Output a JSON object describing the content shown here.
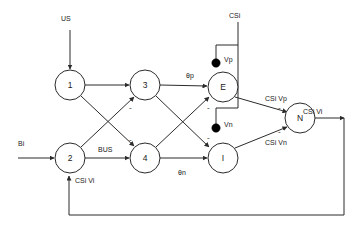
{
  "diagram": {
    "nodes": [
      {
        "id": "n1",
        "label": "1",
        "cx": 70,
        "cy": 85,
        "r": 15
      },
      {
        "id": "n2",
        "label": "2",
        "cx": 70,
        "cy": 158,
        "r": 15
      },
      {
        "id": "n3",
        "label": "3",
        "cx": 145,
        "cy": 85,
        "r": 15
      },
      {
        "id": "n4",
        "label": "4",
        "cx": 145,
        "cy": 158,
        "r": 15
      },
      {
        "id": "nE",
        "label": "E",
        "cx": 223,
        "cy": 87,
        "r": 15
      },
      {
        "id": "nI",
        "label": "I",
        "cx": 223,
        "cy": 158,
        "r": 15
      },
      {
        "id": "nN",
        "label": "N",
        "cx": 300,
        "cy": 118,
        "r": 15
      }
    ],
    "inputs": {
      "us_label": "US",
      "bi_label": "Bi",
      "csi_top_label": "CSi"
    },
    "edge_labels": {
      "bus": "BUS",
      "theta_p": "θp",
      "theta_n": "θn",
      "vp": "Vp",
      "vn": "Vn",
      "csi_vi_feedback": "CSi  Vi",
      "csi_vp": "CSi  Vp",
      "csi_vn": "CSi  Vn",
      "csi_vi_output": "CSi  Vi"
    },
    "sign_labels": {
      "minus_into_3": "-",
      "minus_into_4": "-",
      "minus_into_e": "-",
      "minus_into_i": "-",
      "minus_n_upper": "-",
      "minus_n_lower": "-"
    },
    "colors": {
      "stroke": "#2b2b2b",
      "text": "#1a1a1a",
      "dot": "#000000",
      "background": "#ffffff"
    }
  }
}
